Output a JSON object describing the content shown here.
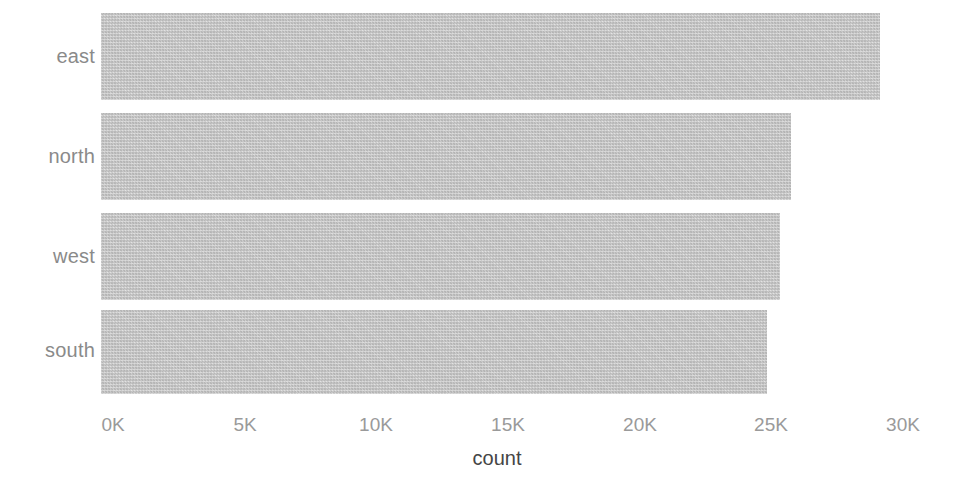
{
  "chart_data": {
    "type": "bar",
    "orientation": "horizontal",
    "title": "",
    "subtitle": "",
    "xlabel": "count",
    "ylabel": "",
    "categories": [
      "east",
      "north",
      "west",
      "south"
    ],
    "values": [
      29600,
      26200,
      25800,
      25300
    ],
    "series": [
      {
        "name": "count",
        "values": [
          29600,
          26200,
          25800,
          25300
        ]
      }
    ],
    "xlim": [
      0,
      30000
    ],
    "ylim": null,
    "xticks": [
      0,
      5000,
      10000,
      15000,
      20000,
      25000,
      30000
    ],
    "xtick_labels": [
      "0K",
      "5K",
      "10K",
      "15K",
      "20K",
      "25K",
      "30K"
    ],
    "grid": false,
    "legend": false,
    "legend_position": "none",
    "annotations": [],
    "bar_color": "#c3c3c3",
    "background_color": "#ffffff",
    "tick_label_color": "#9a9a9a",
    "category_label_color": "#8a8a8a",
    "axis_title_color": "#454545"
  }
}
